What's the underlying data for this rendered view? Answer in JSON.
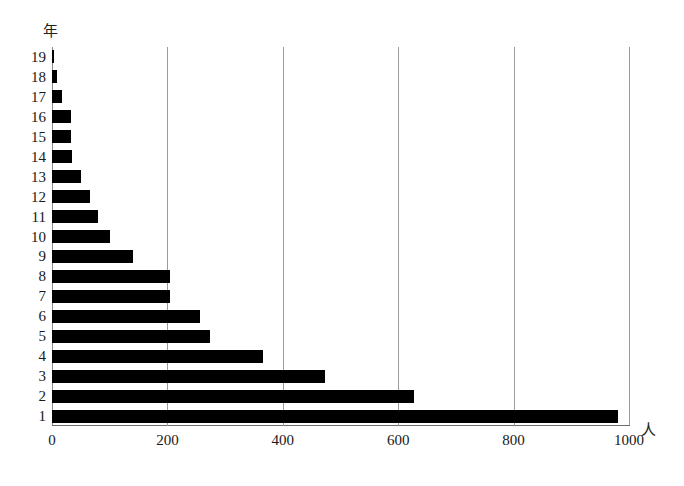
{
  "chart_data": {
    "type": "bar",
    "orientation": "horizontal",
    "title": "",
    "xlabel": "人",
    "ylabel": "年",
    "categories": [
      "1",
      "2",
      "3",
      "4",
      "5",
      "6",
      "7",
      "8",
      "9",
      "10",
      "11",
      "12",
      "13",
      "14",
      "15",
      "16",
      "17",
      "18",
      "19"
    ],
    "values": [
      981,
      628,
      474,
      365,
      274,
      257,
      205,
      205,
      141,
      101,
      80,
      66,
      50,
      35,
      33,
      33,
      17,
      8,
      3
    ],
    "xlim": [
      0,
      1000
    ],
    "xticks": [
      0,
      200,
      400,
      600,
      800,
      1000
    ],
    "xtick_labels": [
      "0",
      "200",
      "400",
      "600",
      "800",
      "1000"
    ],
    "ytick_labels": [
      "19",
      "18",
      "17",
      "16",
      "15",
      "14",
      "13",
      "12",
      "11",
      "10",
      "9",
      "8",
      "7",
      "6",
      "5",
      "4",
      "3",
      "2",
      "1"
    ],
    "grid": "vertical-only",
    "legend": "none",
    "bar_color": "#000000",
    "grid_color": "#9b9b9b",
    "axis_color": "#6b6b6b"
  },
  "axes": {
    "y_unit_caption": "年",
    "x_unit_caption": "人"
  }
}
